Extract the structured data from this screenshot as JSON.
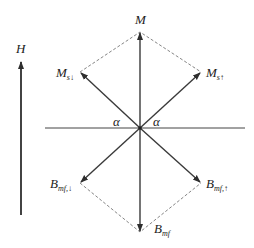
{
  "diagram": {
    "field_label": "H",
    "angle_label": "α",
    "vectors": {
      "M": {
        "label": "M",
        "sub": ""
      },
      "M_s_down": {
        "label": "M",
        "sub": "s↓"
      },
      "M_s_up": {
        "label": "M",
        "sub": "s↑"
      },
      "B_mf_down": {
        "label": "B",
        "sub": "mf,↓"
      },
      "B_mf_up": {
        "label": "B",
        "sub": "mf,↑"
      },
      "B_mf": {
        "label": "B",
        "sub": "mf"
      }
    },
    "colors": {
      "arrow": "#3a3a3a",
      "dashed": "#777777",
      "axis": "#444444",
      "text": "#222222"
    }
  }
}
